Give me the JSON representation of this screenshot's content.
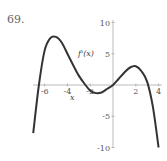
{
  "problem": {
    "number": "69."
  },
  "chart_data": {
    "type": "line",
    "title": "",
    "xlabel": "x",
    "ylabel": "",
    "curve_label": "f'(x)",
    "xlim": [
      -7,
      4
    ],
    "ylim": [
      -10,
      10
    ],
    "x_ticks": [
      -6,
      -4,
      -2,
      2,
      4
    ],
    "x_tick_labels": [
      "-6",
      "-4",
      "-2",
      "2",
      "4"
    ],
    "y_ticks": [
      10,
      5,
      -5,
      -10
    ],
    "y_tick_labels": [
      "10",
      "5",
      "-5",
      "-10"
    ],
    "grid": false,
    "series": [
      {
        "name": "f'(x)",
        "x": [
          -7,
          -6.5,
          -6,
          -5.5,
          -5,
          -4.5,
          -4,
          -3.5,
          -3,
          -2.5,
          -2,
          -1.5,
          -1,
          -0.5,
          0,
          0.5,
          1,
          1.5,
          2,
          2.5,
          3,
          3.5,
          4
        ],
        "y": [
          -7.7,
          0,
          5.5,
          7.5,
          7.7,
          6.8,
          5.0,
          3.2,
          1.5,
          0.2,
          -0.9,
          -1.3,
          -1.2,
          -0.6,
          0,
          1.0,
          2.0,
          2.8,
          3.0,
          2.2,
          0.5,
          -3.5,
          -10
        ]
      }
    ],
    "color": "#333333"
  }
}
